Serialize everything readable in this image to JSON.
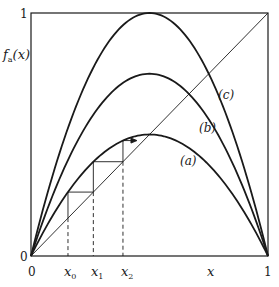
{
  "figure": {
    "y_axis_label": "f",
    "y_axis_label_sub": "a",
    "y_axis_label_arg": "(x)",
    "y_tick_top": "1",
    "y_tick_bottom": "0",
    "x_tick_left": "0",
    "x_tick_right": "1",
    "x_axis_label": "x",
    "iterate_labels": [
      {
        "base": "x",
        "sub": "0"
      },
      {
        "base": "x",
        "sub": "1"
      },
      {
        "base": "x",
        "sub": "2"
      }
    ],
    "curve_labels": {
      "a": "(a)",
      "b": "(b)",
      "c": "(c)"
    },
    "colors": {
      "ink": "#1a1a1a",
      "background": "#ffffff"
    }
  },
  "chart_data": {
    "type": "line",
    "title": "",
    "xlabel": "x",
    "ylabel": "f_a(x)",
    "xlim": [
      0,
      1
    ],
    "ylim": [
      0,
      1
    ],
    "grid": false,
    "series": [
      {
        "name": "(a)",
        "function": "f(x) = 2x(1-x)",
        "peak": 0.5
      },
      {
        "name": "(b)",
        "function": "f(x) = 3x(1-x)",
        "peak": 0.75
      },
      {
        "name": "(c)",
        "function": "f(x) = 4x(1-x)",
        "peak": 1.0
      },
      {
        "name": "diagonal",
        "function": "y = x"
      }
    ],
    "cobweb": {
      "curve": "(a)",
      "iterates": [
        0.156,
        0.263,
        0.388,
        0.475
      ],
      "labels": [
        "x0",
        "x1",
        "x2"
      ]
    }
  }
}
